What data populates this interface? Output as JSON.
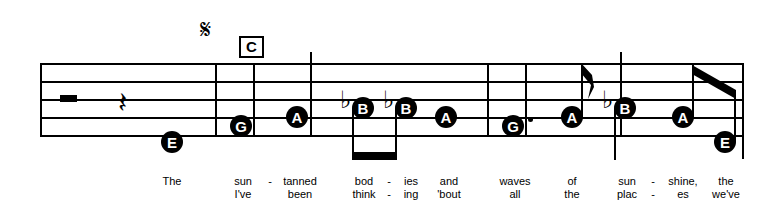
{
  "score": {
    "navigation": {
      "segno": "𝄋",
      "segno_name": "segno-sign",
      "rehearsal_mark": "C"
    },
    "staff": {
      "line_count": 5,
      "left": 40,
      "right": 742,
      "line_y": [
        63,
        81,
        99,
        117,
        135
      ]
    },
    "barlines": [
      {
        "x": 215,
        "top": 63,
        "bottom": 135,
        "kind": "measure"
      },
      {
        "x": 253,
        "top": 63,
        "bottom": 135,
        "kind": "measure"
      },
      {
        "x": 310,
        "top": 52,
        "bottom": 135,
        "kind": "measure-tall"
      },
      {
        "x": 487,
        "top": 63,
        "bottom": 135,
        "kind": "measure"
      },
      {
        "x": 525,
        "top": 63,
        "bottom": 135,
        "kind": "measure"
      },
      {
        "x": 620,
        "top": 52,
        "bottom": 135,
        "kind": "measure-tall"
      },
      {
        "x": 742,
        "top": 63,
        "bottom": 157,
        "kind": "final"
      }
    ],
    "rests": [
      {
        "type": "half-rest",
        "x": 60,
        "y": 95
      },
      {
        "type": "quarter-rest",
        "x": 118,
        "y": 88
      }
    ],
    "notes": [
      {
        "letter": "E",
        "x": 172,
        "y": 142,
        "accidental": "",
        "stem": "none",
        "dotted": false,
        "beam": "none"
      },
      {
        "letter": "G",
        "x": 241,
        "y": 126,
        "accidental": "",
        "stem": "none",
        "dotted": false,
        "beam": "none"
      },
      {
        "letter": "A",
        "x": 297,
        "y": 117,
        "accidental": "",
        "stem": "none",
        "dotted": false,
        "beam": "none"
      },
      {
        "letter": "B",
        "x": 363,
        "y": 108,
        "accidental": "♭",
        "stem": "down",
        "dotted": false,
        "beam": "flat-beam-1"
      },
      {
        "letter": "B",
        "x": 406,
        "y": 108,
        "accidental": "♭",
        "stem": "down",
        "dotted": false,
        "beam": "flat-beam-1"
      },
      {
        "letter": "A",
        "x": 446,
        "y": 117,
        "accidental": "",
        "stem": "none",
        "dotted": false,
        "beam": "none"
      },
      {
        "letter": "G",
        "x": 513,
        "y": 126,
        "accidental": "",
        "stem": "none",
        "dotted": true,
        "beam": "none"
      },
      {
        "letter": "A",
        "x": 572,
        "y": 117,
        "accidental": "",
        "stem": "up",
        "dotted": false,
        "beam": "flag-8th"
      },
      {
        "letter": "B",
        "x": 625,
        "y": 108,
        "accidental": "♭",
        "stem": "down",
        "dotted": false,
        "beam": "none"
      },
      {
        "letter": "A",
        "x": 683,
        "y": 117,
        "accidental": "",
        "stem": "up",
        "dotted": false,
        "beam": "angled-beam-2"
      },
      {
        "letter": "E",
        "x": 725,
        "y": 142,
        "accidental": "",
        "stem": "up",
        "dotted": false,
        "beam": "angled-beam-2"
      }
    ],
    "lyrics": {
      "verse1": [
        {
          "text": "The",
          "x": 172
        },
        {
          "text": "sun",
          "x": 243
        },
        {
          "text": "-",
          "x": 270
        },
        {
          "text": "tanned",
          "x": 300
        },
        {
          "text": "bod",
          "x": 364
        },
        {
          "text": "-",
          "x": 389
        },
        {
          "text": "ies",
          "x": 411
        },
        {
          "text": "and",
          "x": 449
        },
        {
          "text": "waves",
          "x": 515
        },
        {
          "text": "of",
          "x": 572
        },
        {
          "text": "sun",
          "x": 627
        },
        {
          "text": "-",
          "x": 653
        },
        {
          "text": "shine,",
          "x": 683
        },
        {
          "text": "the",
          "x": 726
        }
      ],
      "verse2": [
        {
          "text": "I've",
          "x": 243
        },
        {
          "text": "been",
          "x": 300
        },
        {
          "text": "think",
          "x": 364
        },
        {
          "text": "-",
          "x": 389
        },
        {
          "text": "ing",
          "x": 411
        },
        {
          "text": "'bout",
          "x": 449
        },
        {
          "text": "all",
          "x": 515
        },
        {
          "text": "the",
          "x": 572
        },
        {
          "text": "plac",
          "x": 627
        },
        {
          "text": "-",
          "x": 653
        },
        {
          "text": "es",
          "x": 683
        },
        {
          "text": "we've",
          "x": 726
        }
      ]
    }
  }
}
